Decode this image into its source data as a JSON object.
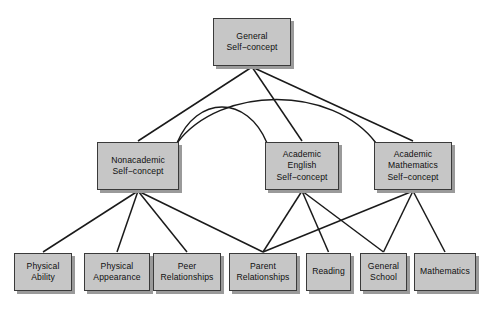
{
  "diagram": {
    "background_color": "#ffffff",
    "node_fill_color": "#c6c6c6",
    "node_border_color": "#3a3a3a",
    "node_shadow_color": "#9a9a9a",
    "edge_color": "#1a1a1a",
    "nodes": [
      {
        "id": "general",
        "label": "General\nSelf−concept",
        "label_lines": [
          "General",
          "Self−concept"
        ],
        "tier": 1,
        "x": 213,
        "y": 18,
        "w": 78,
        "h": 48
      },
      {
        "id": "nonacademic",
        "label": "Nonacademic\nSelf−concept",
        "label_lines": [
          "Nonacademic",
          "Self−concept"
        ],
        "tier": 2,
        "x": 97,
        "y": 142,
        "w": 82,
        "h": 48
      },
      {
        "id": "academic-english",
        "label": "Academic\nEnglish\nSelf−concept",
        "label_lines": [
          "Academic",
          "English",
          "Self−concept"
        ],
        "tier": 2,
        "x": 265,
        "y": 142,
        "w": 74,
        "h": 48
      },
      {
        "id": "academic-mathematics",
        "label": "Academic\nMathematics\nSelf−concept",
        "label_lines": [
          "Academic",
          "Mathematics",
          "Self−concept"
        ],
        "tier": 2,
        "x": 374,
        "y": 142,
        "w": 78,
        "h": 48
      },
      {
        "id": "physical-ability",
        "label": "Physical\nAbility",
        "label_lines": [
          "Physical",
          "Ability"
        ],
        "tier": 3,
        "x": 14,
        "y": 253,
        "w": 58,
        "h": 38
      },
      {
        "id": "physical-appearance",
        "label": "Physical\nAppearance",
        "label_lines": [
          "Physical",
          "Appearance"
        ],
        "tier": 3,
        "x": 84,
        "y": 253,
        "w": 66,
        "h": 38
      },
      {
        "id": "peer-relationships",
        "label": "Peer\nRelationships",
        "label_lines": [
          "Peer",
          "Relationships"
        ],
        "tier": 3,
        "x": 153,
        "y": 253,
        "w": 68,
        "h": 38
      },
      {
        "id": "parent-relationships",
        "label": "Parent\nRelationships",
        "label_lines": [
          "Parent",
          "Relationships"
        ],
        "tier": 3,
        "x": 229,
        "y": 253,
        "w": 68,
        "h": 38
      },
      {
        "id": "reading",
        "label": "Reading",
        "label_lines": [
          "Reading"
        ],
        "tier": 3,
        "x": 306,
        "y": 253,
        "w": 45,
        "h": 38
      },
      {
        "id": "general-school",
        "label": "General\nSchool",
        "label_lines": [
          "General",
          "School"
        ],
        "tier": 3,
        "x": 360,
        "y": 253,
        "w": 47,
        "h": 38
      },
      {
        "id": "mathematics",
        "label": "Mathematics",
        "label_lines": [
          "Mathematics"
        ],
        "tier": 3,
        "x": 414,
        "y": 253,
        "w": 62,
        "h": 38
      }
    ],
    "edges": [
      {
        "from": "general",
        "to": "nonacademic",
        "kind": "straight"
      },
      {
        "from": "general",
        "to": "academic-english",
        "kind": "straight"
      },
      {
        "from": "general",
        "to": "academic-mathematics",
        "kind": "straight"
      },
      {
        "from": "nonacademic",
        "to": "academic-english",
        "kind": "curved"
      },
      {
        "from": "nonacademic",
        "to": "academic-mathematics",
        "kind": "curved"
      },
      {
        "from": "nonacademic",
        "to": "physical-ability",
        "kind": "straight"
      },
      {
        "from": "nonacademic",
        "to": "physical-appearance",
        "kind": "straight"
      },
      {
        "from": "nonacademic",
        "to": "peer-relationships",
        "kind": "straight"
      },
      {
        "from": "nonacademic",
        "to": "parent-relationships",
        "kind": "straight"
      },
      {
        "from": "academic-english",
        "to": "parent-relationships",
        "kind": "straight"
      },
      {
        "from": "academic-english",
        "to": "reading",
        "kind": "straight"
      },
      {
        "from": "academic-english",
        "to": "general-school",
        "kind": "straight"
      },
      {
        "from": "academic-mathematics",
        "to": "parent-relationships",
        "kind": "straight"
      },
      {
        "from": "academic-mathematics",
        "to": "general-school",
        "kind": "straight"
      },
      {
        "from": "academic-mathematics",
        "to": "mathematics",
        "kind": "straight"
      }
    ]
  }
}
